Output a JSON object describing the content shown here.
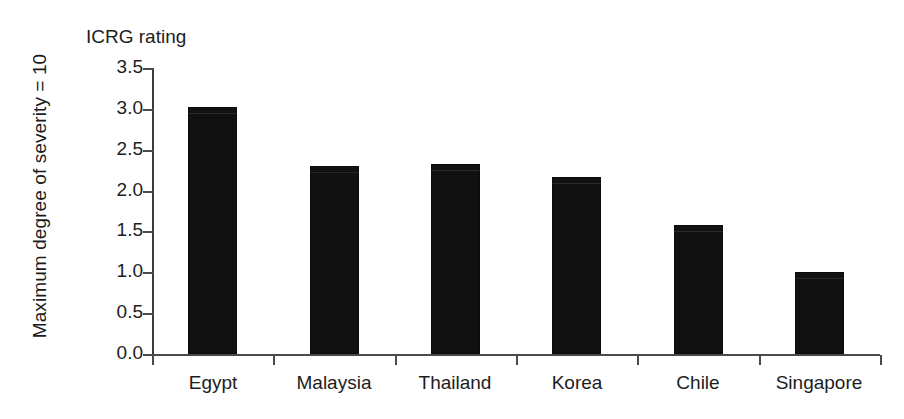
{
  "chart_data": {
    "type": "bar",
    "title": "ICRG rating",
    "xlabel": "",
    "ylabel": "Maximum degree of severity = 10",
    "categories": [
      "Egypt",
      "Malaysia",
      "Thailand",
      "Korea",
      "Chile",
      "Singapore"
    ],
    "values": [
      3.02,
      2.3,
      2.32,
      2.16,
      1.58,
      1.0
    ],
    "ylim": [
      0.0,
      3.5
    ],
    "ytick_labels": [
      "0.0",
      "0.5",
      "1.0",
      "1.5",
      "2.0",
      "2.5",
      "3.0",
      "3.5"
    ],
    "ytick_values": [
      0.0,
      0.5,
      1.0,
      1.5,
      2.0,
      2.5,
      3.0,
      3.5
    ],
    "grid": false,
    "legend": false,
    "bar_color": "#111111",
    "axis_color": "#4a4a4a",
    "background_color": "#ffffff"
  }
}
